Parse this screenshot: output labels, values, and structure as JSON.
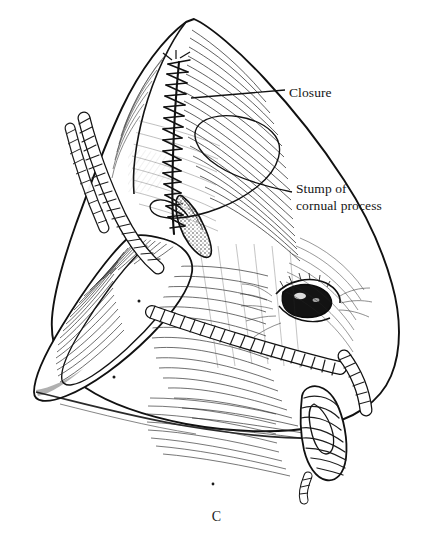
{
  "figure": {
    "caption": "C",
    "background_color": "#ffffff",
    "ink_color": "#111111",
    "width": 433,
    "height": 546
  },
  "labels": [
    {
      "id": "closure",
      "text": "Closure",
      "line1": "Closure",
      "line2": "",
      "leader": "straight-line",
      "x": 289,
      "y": 85
    },
    {
      "id": "stump",
      "text": "Stump of cornual process",
      "line1": "Stump of",
      "line2": "cornual process",
      "leader": "curved-loop-line",
      "x": 296,
      "y": 181
    }
  ],
  "anatomy": {
    "suture_label": "continuous interlocking suture line",
    "suture_stitch_count": 17,
    "parts": [
      "poll",
      "frontal-bone",
      "cornual-process-stump",
      "ear",
      "eye",
      "cheek",
      "neck"
    ]
  },
  "restraint": {
    "type": "rope-halter",
    "knot": "halter-knot",
    "strands": 2
  }
}
